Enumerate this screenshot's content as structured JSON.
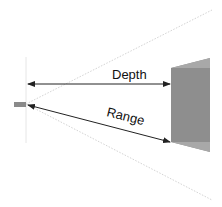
{
  "diagram": {
    "labels": {
      "depth": "Depth",
      "range": "Range"
    },
    "colors": {
      "background": "#ffffff",
      "sensor": "#8a8a8a",
      "target_face": "#8e8e8e",
      "target_top": "#a8a8a8",
      "arrow": "#222222",
      "fov_lines": "#d4d4d4"
    }
  }
}
